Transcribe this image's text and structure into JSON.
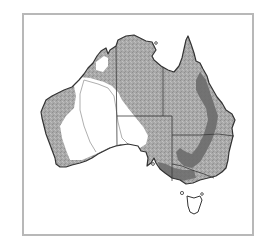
{
  "map": {
    "subject": "Australia",
    "frame": {
      "border_color": "#b8b8b8"
    },
    "colors": {
      "outline": "#333333",
      "state_border": "#3a3a3a",
      "region_light": "#ffffff",
      "region_medium": "#a9a9a9",
      "region_dark": "#6b6b6b",
      "contour": "#9a9a9a"
    },
    "regions": [
      {
        "name": "light-interior",
        "shade": "region_light"
      },
      {
        "name": "medium-speckled",
        "shade": "region_medium"
      },
      {
        "name": "dark-eastern-band",
        "shade": "region_dark"
      }
    ],
    "states": [
      "WA",
      "NT",
      "SA",
      "QLD",
      "NSW",
      "VIC",
      "TAS"
    ]
  }
}
